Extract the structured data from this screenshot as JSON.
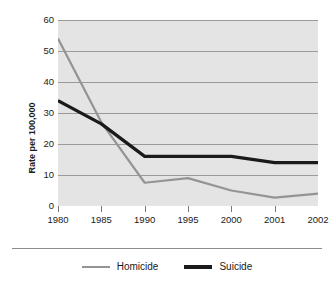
{
  "chart_data": {
    "type": "line",
    "title": "",
    "xlabel": "",
    "ylabel": "Rate per 100,000",
    "x": [
      "1980",
      "1985",
      "1990",
      "1995",
      "2000",
      "2001",
      "2002"
    ],
    "categories": [
      "1980",
      "1985",
      "1990",
      "1995",
      "2000",
      "2001",
      "2002"
    ],
    "series": [
      {
        "name": "Homicide",
        "color": "#949494",
        "values": [
          54,
          27,
          7.5,
          9,
          5,
          2.7,
          4
        ]
      },
      {
        "name": "Suicide",
        "color": "#1a1a1a",
        "values": [
          34,
          26.5,
          16,
          16,
          16,
          14,
          14
        ]
      }
    ],
    "ylim": [
      0,
      60
    ],
    "yticks": [
      0,
      10,
      20,
      30,
      40,
      50,
      60
    ],
    "ytick_labels": [
      "0",
      "10",
      "20",
      "30",
      "40",
      "50",
      "60"
    ],
    "grid": true,
    "grid_axis": "y",
    "legend_position": "bottom",
    "plot_background": "#e4e4e4",
    "gridline_color": "#9a9a9a"
  },
  "legend": {
    "items": [
      {
        "label": "Homicide",
        "swatch": "homicide-line-swatch"
      },
      {
        "label": "Suicide",
        "swatch": "suicide-line-swatch"
      }
    ]
  }
}
